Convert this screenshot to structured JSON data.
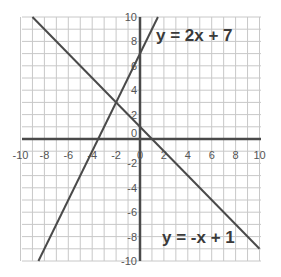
{
  "chart_data": {
    "type": "line",
    "title": "",
    "xlabel": "",
    "ylabel": "",
    "xlim": [
      -10,
      10
    ],
    "ylim": [
      -10,
      10
    ],
    "grid": true,
    "x_ticks": [
      -10,
      -8,
      -6,
      -4,
      -2,
      0,
      2,
      4,
      6,
      8,
      10
    ],
    "y_ticks": [
      -10,
      -8,
      -6,
      -4,
      -2,
      0,
      2,
      4,
      6,
      8,
      10
    ],
    "x_tick_labels": [
      "-10",
      "-8",
      "-6",
      "-4",
      "-2",
      "0",
      "2",
      "4",
      "6",
      "8",
      "10"
    ],
    "y_tick_labels": [
      "-10",
      "-8",
      "-6",
      "-4",
      "-2",
      "0",
      "2",
      "4",
      "6",
      "8",
      "10"
    ],
    "series": [
      {
        "name": "y = 2x + 7",
        "slope": 2,
        "intercept": 7,
        "x": [
          -8.5,
          1.5
        ],
        "y": [
          -10,
          10
        ]
      },
      {
        "name": "y = -x + 1",
        "slope": -1,
        "intercept": 1,
        "x": [
          -9,
          10
        ],
        "y": [
          10,
          -9
        ]
      }
    ],
    "annotations": [
      {
        "text": "y = 2x + 7",
        "x": 1.5,
        "y": 8.5
      },
      {
        "text": "y = -x + 1",
        "x": 2,
        "y": -8.3
      }
    ],
    "intersection": {
      "x": -2,
      "y": 3
    }
  },
  "labels": {
    "eq1": "y = 2x + 7",
    "eq2": "y = -x + 1"
  },
  "colors": {
    "grid": "#c8c8c8",
    "axis": "#4a4a4a",
    "line": "#4a4a4a",
    "text": "#3a3a3a"
  }
}
